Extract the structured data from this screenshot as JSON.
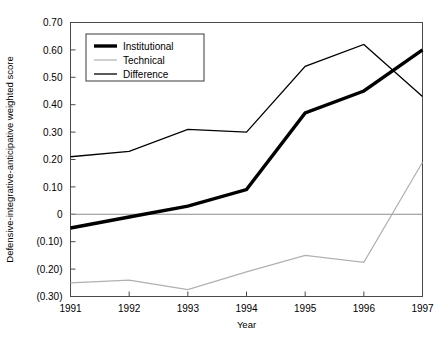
{
  "chart_data": {
    "type": "line",
    "title": "",
    "xlabel": "Year",
    "ylabel": "Defensive-integrative-anticipative weighted score",
    "x": [
      1991,
      1992,
      1993,
      1994,
      1995,
      1996,
      1997
    ],
    "categories": [
      "1991",
      "1992",
      "1993",
      "1994",
      "1995",
      "1996",
      "1997"
    ],
    "xlim": [
      1991,
      1997
    ],
    "ylim": [
      -0.3,
      0.7
    ],
    "grid": false,
    "zero_line": true,
    "legend_position": "top-left",
    "yticks": [
      0.7,
      0.6,
      0.5,
      0.4,
      0.3,
      0.2,
      0.1,
      0.0,
      -0.1,
      -0.2,
      -0.3
    ],
    "ytick_labels": [
      "0.70",
      "0.60",
      "0.50",
      "0.40",
      "0.30",
      "0.20",
      "0.10",
      "0",
      "(0.10)",
      "(0.20)",
      "(0.30)"
    ],
    "series": [
      {
        "name": "Institutional",
        "color": "#000000",
        "width": 3.4,
        "values": [
          -0.05,
          -0.01,
          0.03,
          0.09,
          0.37,
          0.45,
          0.6
        ]
      },
      {
        "name": "Technical",
        "color": "#b0b0b0",
        "width": 1.2,
        "values": [
          -0.25,
          -0.24,
          -0.275,
          -0.21,
          -0.15,
          -0.175,
          0.19
        ]
      },
      {
        "name": "Difference",
        "color": "#000000",
        "width": 1.3,
        "values": [
          0.21,
          0.23,
          0.31,
          0.3,
          0.54,
          0.62,
          0.43
        ]
      }
    ]
  },
  "legend": {
    "items": [
      {
        "label": "Institutional"
      },
      {
        "label": "Technical"
      },
      {
        "label": "Difference"
      }
    ]
  }
}
